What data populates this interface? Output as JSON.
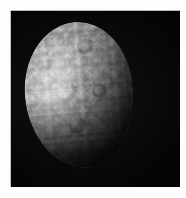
{
  "image": {
    "title": "Cratered icy moon",
    "alt_text": "Grayscale spacecraft image of a heavily cratered icy moon, illuminated from the upper left, against a black sky",
    "subject": "icy satellite",
    "caption": "",
    "colors": {
      "background": "#fdfdfd",
      "sky": "#030303",
      "terminator_shadow": "#000000",
      "surface_bright": "#e4e4e2",
      "surface_mid": "#a9a9a7",
      "surface_dark": "#3e3e3d",
      "plate_border": "#b8b8b8"
    },
    "plate": {
      "left": 10,
      "top": 10,
      "width": 170,
      "height": 177
    },
    "body": {
      "shape": "oval-disc",
      "phase": "gibbous",
      "illumination_direction": "upper-left",
      "center_x": 68,
      "center_y": 94,
      "width": 108,
      "height": 146,
      "rotation_deg": -5,
      "terminator_angle_deg": 118,
      "highlight_x_pct": 25,
      "highlight_y_pct": 47
    },
    "features": [
      {
        "name": "bright-limb",
        "position": "left",
        "brightness": "high"
      },
      {
        "name": "specular-highlight",
        "position": "mid-left",
        "brightness": "highest"
      },
      {
        "name": "crater-field",
        "position": "full-disc",
        "brightness": "mixed"
      },
      {
        "name": "terminator",
        "position": "right",
        "brightness": "fading-to-black"
      },
      {
        "name": "shadowed-south-limb",
        "position": "bottom",
        "brightness": "low"
      }
    ]
  }
}
